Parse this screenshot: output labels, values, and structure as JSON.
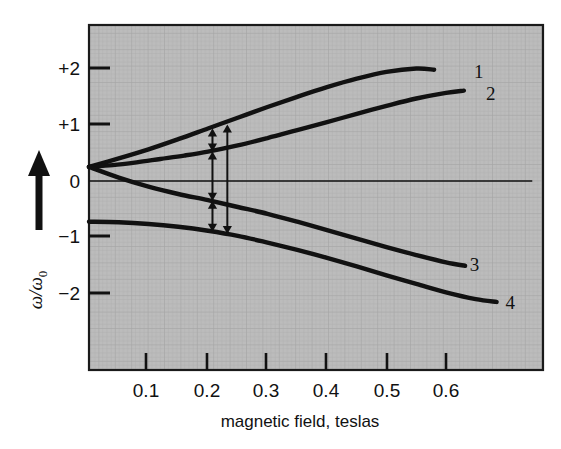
{
  "chart_data": {
    "type": "line",
    "title": "",
    "xlabel": "magnetic field, teslas",
    "ylabel": "ω/ω₀",
    "xlim": [
      0,
      0.79
    ],
    "ylim": [
      -2.85,
      2.45
    ],
    "xticks": [
      0.1,
      0.2,
      0.3,
      0.4,
      0.5,
      0.6
    ],
    "xtick_labels": [
      "0.1",
      "0.2",
      "0.3",
      "0.4",
      "0.5",
      "0.6"
    ],
    "yticks": [
      2,
      1,
      0,
      -1,
      -2
    ],
    "ytick_labels": [
      "+2",
      "+1",
      "0",
      "−1",
      "−2"
    ],
    "grid": true,
    "grid_style": "fine cross-hatch texture",
    "legend": "inline end-of-curve numeric labels",
    "background_color": "#b9b9b9",
    "curve_color": "#111111",
    "zero_line": {
      "y": 0,
      "x_start": 0.0,
      "x_end": 0.745
    },
    "series": [
      {
        "name": "1",
        "label": "1",
        "label_x": 0.655,
        "label_y": 1.95,
        "points": [
          [
            0.0,
            0.25
          ],
          [
            0.05,
            0.4
          ],
          [
            0.1,
            0.56
          ],
          [
            0.15,
            0.74
          ],
          [
            0.2,
            0.93
          ],
          [
            0.25,
            1.12
          ],
          [
            0.3,
            1.31
          ],
          [
            0.35,
            1.49
          ],
          [
            0.4,
            1.66
          ],
          [
            0.45,
            1.81
          ],
          [
            0.5,
            1.93
          ],
          [
            0.55,
            1.99
          ],
          [
            0.58,
            1.97
          ]
        ]
      },
      {
        "name": "2",
        "label": "2",
        "label_x": 0.675,
        "label_y": 1.55,
        "points": [
          [
            0.0,
            0.25
          ],
          [
            0.04,
            0.28
          ],
          [
            0.08,
            0.33
          ],
          [
            0.12,
            0.39
          ],
          [
            0.16,
            0.45
          ],
          [
            0.2,
            0.52
          ],
          [
            0.25,
            0.63
          ],
          [
            0.3,
            0.76
          ],
          [
            0.35,
            0.9
          ],
          [
            0.4,
            1.04
          ],
          [
            0.45,
            1.19
          ],
          [
            0.5,
            1.33
          ],
          [
            0.55,
            1.46
          ],
          [
            0.6,
            1.56
          ],
          [
            0.63,
            1.6
          ]
        ]
      },
      {
        "name": "3",
        "label": "3",
        "label_x": 0.648,
        "label_y": -1.47,
        "points": [
          [
            0.0,
            0.25
          ],
          [
            0.05,
            0.06
          ],
          [
            0.1,
            -0.1
          ],
          [
            0.15,
            -0.23
          ],
          [
            0.2,
            -0.34
          ],
          [
            0.25,
            -0.46
          ],
          [
            0.3,
            -0.58
          ],
          [
            0.35,
            -0.72
          ],
          [
            0.4,
            -0.87
          ],
          [
            0.45,
            -1.02
          ],
          [
            0.5,
            -1.17
          ],
          [
            0.55,
            -1.31
          ],
          [
            0.6,
            -1.44
          ],
          [
            0.632,
            -1.5
          ]
        ]
      },
      {
        "name": "4",
        "label": "4",
        "label_x": 0.708,
        "label_y": -2.15,
        "points": [
          [
            0.0,
            -0.72
          ],
          [
            0.05,
            -0.73
          ],
          [
            0.1,
            -0.76
          ],
          [
            0.15,
            -0.81
          ],
          [
            0.2,
            -0.88
          ],
          [
            0.25,
            -0.97
          ],
          [
            0.3,
            -1.09
          ],
          [
            0.35,
            -1.22
          ],
          [
            0.4,
            -1.36
          ],
          [
            0.45,
            -1.51
          ],
          [
            0.5,
            -1.67
          ],
          [
            0.55,
            -1.82
          ],
          [
            0.6,
            -1.97
          ],
          [
            0.65,
            -2.09
          ],
          [
            0.685,
            -2.14
          ]
        ]
      }
    ],
    "annotations": [
      {
        "name": "transition-arrow-1-2",
        "kind": "double-arrow",
        "x": 0.2075,
        "y_top": 0.93,
        "y_bottom": 0.52
      },
      {
        "name": "transition-arrow-2-3",
        "kind": "double-arrow",
        "x": 0.2075,
        "y_top": 0.52,
        "y_bottom": -0.35
      },
      {
        "name": "transition-arrow-3-4",
        "kind": "double-arrow",
        "x": 0.2075,
        "y_top": -0.35,
        "y_bottom": -0.9
      },
      {
        "name": "transition-arrow-1-4",
        "kind": "double-arrow",
        "x": 0.2325,
        "y_top": 1.0,
        "y_bottom": -0.94
      }
    ]
  },
  "axes": {
    "x_axis_label": "magnetic field, teslas",
    "y_axis_label_main": "ω/ω",
    "y_axis_label_sub": "0",
    "y_arrow": "up-arrow"
  },
  "tick_text": {
    "y": [
      "+2",
      "+1",
      "0",
      "−1",
      "−2"
    ],
    "x": [
      "0.1",
      "0.2",
      "0.3",
      "0.4",
      "0.5",
      "0.6"
    ]
  },
  "curve_labels": [
    "1",
    "2",
    "3",
    "4"
  ]
}
